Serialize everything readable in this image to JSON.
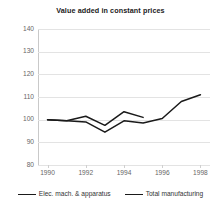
{
  "chart_data": {
    "type": "line",
    "title": "Value added in constant prices",
    "xlabel": "",
    "ylabel": "",
    "x": [
      1990,
      1991,
      1992,
      1993,
      1994,
      1995,
      1996,
      1997,
      1998
    ],
    "xtick_labels": [
      "1990",
      "1992",
      "1994",
      "1996",
      "1998"
    ],
    "xtick_values": [
      1990,
      1992,
      1994,
      1996,
      1998
    ],
    "ytick_labels": [
      "80",
      "90",
      "100",
      "110",
      "120",
      "130",
      "140"
    ],
    "ytick_values": [
      80,
      90,
      100,
      110,
      120,
      130,
      140
    ],
    "xlim": [
      1989.5,
      1998.5
    ],
    "ylim": [
      80,
      140
    ],
    "grid": true,
    "grid_axis": "y",
    "legend_position": "bottom",
    "series": [
      {
        "name": "Elec. mach. & apparatus",
        "color": "#1a1a1a",
        "x": [
          1990,
          1991,
          1992,
          1993,
          1994,
          1995
        ],
        "values": [
          100,
          99.5,
          101.5,
          97.5,
          103.5,
          101
        ]
      },
      {
        "name": "Total manufacturing",
        "color": "#1a1a1a",
        "x": [
          1990,
          1991,
          1992,
          1993,
          1994,
          1995,
          1996,
          1997,
          1998
        ],
        "values": [
          100,
          99.5,
          99,
          94.5,
          99.5,
          98.5,
          100.5,
          108,
          111
        ]
      }
    ]
  },
  "legend": {
    "items": [
      {
        "label": "Elec. mach. & apparatus"
      },
      {
        "label": "Total manufacturing"
      }
    ]
  },
  "colors": {
    "grid": "#e3e3e3",
    "axis": "#c9c9c9",
    "line": "#1a1a1a",
    "tick_text": "#666666",
    "title_text": "#1a1a1a",
    "background": "#ffffff"
  }
}
